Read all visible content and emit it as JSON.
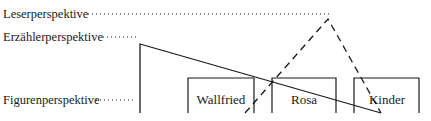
{
  "diagram": {
    "labels": {
      "reader": "Leserperspektive",
      "narrator": "Erzählerperspektive",
      "figure": "Figurenperspektive"
    },
    "boxes": [
      {
        "label": "Wallfried"
      },
      {
        "label": "Rosa"
      },
      {
        "label": "Kinder"
      }
    ],
    "line_styles": {
      "reader": "dashed",
      "narrator": "solid",
      "leader": "dotted"
    },
    "colors": {
      "ink": "#1a1a1a",
      "background": "#ffffff"
    }
  }
}
